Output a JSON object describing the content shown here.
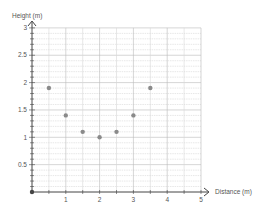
{
  "chart_data": {
    "type": "scatter",
    "title": "",
    "xlabel": "Distance (m)",
    "ylabel": "Height (m)",
    "xlim": [
      0,
      5
    ],
    "ylim": [
      0,
      3
    ],
    "x_ticks": [
      "1",
      "2",
      "3",
      "4",
      "5"
    ],
    "y_ticks": [
      "0.5",
      "1",
      "1.5",
      "2",
      "2.5",
      "3"
    ],
    "grid": true,
    "grid_x_step": 0.5,
    "grid_y_step": 0.1,
    "legend": null,
    "series": [
      {
        "name": "points",
        "color": "#8a8a8a",
        "x": [
          0.5,
          1,
          1.5,
          2,
          2.5,
          3,
          3.5
        ],
        "y": [
          1.9,
          1.4,
          1.1,
          1.0,
          1.1,
          1.4,
          1.9
        ]
      }
    ],
    "origin_marker": {
      "x": 0,
      "y": 0,
      "color": "#444444"
    }
  },
  "colors": {
    "axis": "#444444",
    "grid_major": "#bbbbbb",
    "grid_minor": "#d6d6d6",
    "point": "#8a8a8a",
    "text": "#555555"
  }
}
